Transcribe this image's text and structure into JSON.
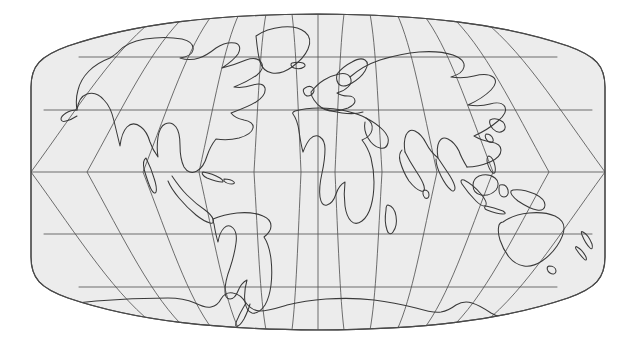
{
  "figure": {
    "type": "world-map",
    "projection_name": "Robinson",
    "title": "",
    "caption": "",
    "background_color": "#ffffff",
    "land_outline_color": "#3a3a3a",
    "ocean_fill_color": "#ececec",
    "graticule_color": "#555555",
    "border_color": "#4a4a4a"
  },
  "map_extent": {
    "left_px": 31,
    "right_px": 605,
    "top_px": 14,
    "bottom_px": 330,
    "center_x_px": 318,
    "center_y_px": 172,
    "half_width_px": 287,
    "half_height_px": 158,
    "lon_min": -180,
    "lon_max": 180,
    "lat_min": -90,
    "lat_max": 90
  },
  "graticule": {
    "visible": true,
    "meridian_interval_deg": 30,
    "parallel_interval_deg": 30,
    "meridians_deg": [
      -180,
      -150,
      -120,
      -90,
      -60,
      -30,
      0,
      30,
      60,
      90,
      120,
      150,
      180
    ],
    "parallels_deg": [
      90,
      60,
      30,
      0,
      -30,
      -60,
      -90
    ],
    "meridian_count": 13,
    "parallel_count": 7,
    "equator_label": "0",
    "prime_meridian_label": "0"
  },
  "labels": {
    "visible": false,
    "items": []
  },
  "landmasses": [
    "North America",
    "South America",
    "Greenland",
    "Eurasia",
    "Africa",
    "Australia",
    "Antarctica",
    "New Guinea",
    "Indonesia",
    "Japan",
    "British Isles",
    "Madagascar",
    "New Zealand",
    "Iceland",
    "Sri Lanka",
    "Cuba",
    "Philippines"
  ]
}
